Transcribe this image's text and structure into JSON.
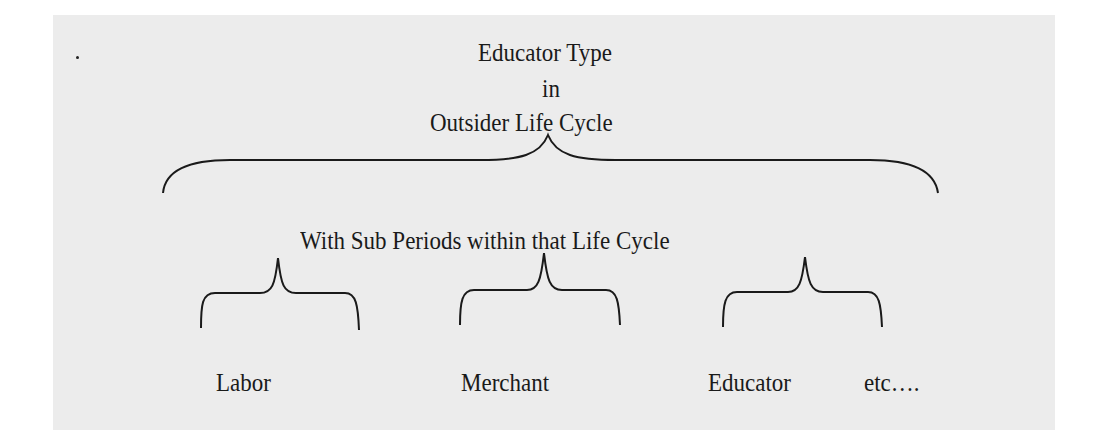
{
  "diagram": {
    "title": {
      "line1": "Educator Type",
      "line2": "in",
      "line3": "Outsider Life Cycle"
    },
    "subtitle": "With Sub Periods within that Life Cycle",
    "sub_periods": [
      {
        "label": "Labor"
      },
      {
        "label": "Merchant"
      },
      {
        "label": "Educator"
      }
    ],
    "continuation": "etc…."
  }
}
